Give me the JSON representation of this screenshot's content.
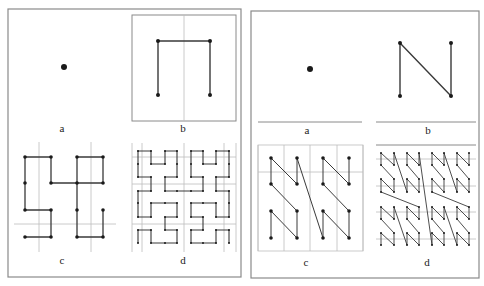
{
  "colors": {
    "frame": "#8a8a8a",
    "grid": "#bdbdbd",
    "curve": "#3a3a3a",
    "dot": "#1a1a1a"
  },
  "left_figure": {
    "name": "hilbert-curve-figure",
    "frame": {
      "x": 8,
      "y": 9,
      "w": 233,
      "h": 268
    },
    "panels": {
      "a": {
        "label": "a",
        "label_pos": [
          62,
          132
        ],
        "dots": [
          [
            64,
            67
          ]
        ]
      },
      "b": {
        "label": "b",
        "label_pos": [
          183,
          132
        ],
        "box": {
          "x": 132,
          "y": 15,
          "w": 104,
          "h": 106
        },
        "divider_x": 184,
        "points": [
          [
            158,
            95
          ],
          [
            158,
            41
          ],
          [
            210,
            41
          ],
          [
            210,
            95
          ]
        ]
      },
      "c": {
        "label": "c",
        "label_pos": [
          62,
          264
        ],
        "grid_v": [
          39,
          91
        ],
        "grid_h": [
          224
        ],
        "grid_span": {
          "x1": 14,
          "x2": 116,
          "y1": 142,
          "y2": 252
        },
        "points": [
          [
            25,
            237
          ],
          [
            51,
            237
          ],
          [
            51,
            210
          ],
          [
            25,
            210
          ],
          [
            25,
            183
          ],
          [
            25,
            157
          ],
          [
            51,
            157
          ],
          [
            51,
            183
          ],
          [
            77,
            183
          ],
          [
            103,
            183
          ],
          [
            103,
            157
          ],
          [
            77,
            157
          ],
          [
            77,
            210
          ],
          [
            77,
            237
          ],
          [
            103,
            237
          ],
          [
            103,
            210
          ]
        ]
      },
      "d": {
        "label": "d",
        "label_pos": [
          183,
          264
        ],
        "order": 3,
        "cols": [
          138,
          151,
          165,
          177,
          191,
          203,
          216,
          229
        ],
        "rows": [
          151,
          164,
          177,
          191,
          203,
          217,
          230,
          243
        ],
        "grid_v": [
          132,
          142,
          184,
          224,
          236
        ],
        "grid_h": [
          157,
          184,
          224
        ],
        "grid_span": {
          "x1": 132,
          "x2": 236,
          "y1": 143,
          "y2": 252
        }
      }
    }
  },
  "right_figure": {
    "name": "z-order-curve-figure",
    "frame": {
      "x": 251,
      "y": 11,
      "w": 228,
      "h": 267
    },
    "panels": {
      "a": {
        "label": "a",
        "label_pos": [
          307,
          134
        ],
        "dots": [
          [
            310,
            69
          ]
        ],
        "underline": [
          258,
          362,
          122
        ]
      },
      "b": {
        "label": "b",
        "label_pos": [
          428,
          134
        ],
        "underline": [
          376,
          476,
          122
        ],
        "points": [
          [
            400,
            96
          ],
          [
            400,
            43
          ],
          [
            451,
            96
          ],
          [
            451,
            43
          ]
        ]
      },
      "c": {
        "label": "c",
        "label_pos": [
          306,
          266
        ],
        "cols": [
          271,
          297,
          323,
          349
        ],
        "rows": [
          158,
          184,
          211,
          238
        ],
        "grid_v": [
          258,
          284,
          310,
          337,
          363
        ],
        "grid_h": [
          172
        ],
        "grid_span": {
          "x1": 258,
          "x2": 363,
          "y1": 145,
          "y2": 251
        }
      },
      "d": {
        "label": "d",
        "label_pos": [
          427,
          266
        ],
        "order": 3,
        "cols": [
          381,
          394,
          407,
          419,
          432,
          444,
          457,
          469
        ],
        "rows": [
          153,
          165,
          179,
          192,
          207,
          219,
          233,
          245
        ],
        "top_line": [
          376,
          476,
          145
        ],
        "grid_h": [
          159,
          186,
          212,
          239
        ],
        "grid_span": {
          "x1": 376,
          "x2": 476
        }
      }
    }
  }
}
